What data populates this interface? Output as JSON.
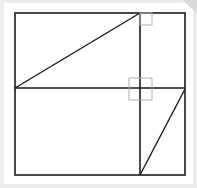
{
  "diagram": {
    "stroke_color": "#1a1a1a",
    "marker_color": "#b0b0b0",
    "background": "#ffffff",
    "outer_frame": {
      "x1": 15,
      "y1": 13,
      "x2": 185,
      "y2": 175
    },
    "vertical_divider_x": 140,
    "horizontal_divider_y": 88,
    "diagonals": [
      {
        "from": [
          15,
          88
        ],
        "to": [
          140,
          13
        ]
      },
      {
        "from": [
          185,
          89
        ],
        "to": [
          140,
          175
        ]
      }
    ],
    "right_angle_markers": [
      {
        "x": 140,
        "y": 13,
        "w": 12,
        "h": 12
      },
      {
        "x": 129,
        "y": 78,
        "w": 23,
        "h": 22
      }
    ]
  }
}
